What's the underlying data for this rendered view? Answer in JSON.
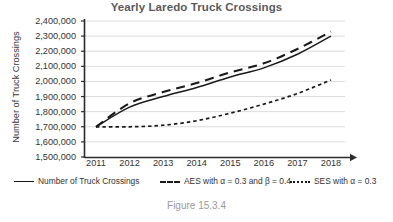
{
  "chart_data": {
    "type": "line",
    "title": "Yearly Laredo Truck Crossings",
    "xlabel": "",
    "ylabel": "Number of Truck Crossings",
    "categories": [
      "2011",
      "2012",
      "2013",
      "2014",
      "2015",
      "2016",
      "2017",
      "2018"
    ],
    "x": [
      2011,
      2012,
      2013,
      2014,
      2015,
      2016,
      2017,
      2018
    ],
    "ylim": [
      1500000,
      2400000
    ],
    "ytick_labels": [
      "2,400,000",
      "2,300,000",
      "2,200,000",
      "2,100,000",
      "2,000,000",
      "1,900,000",
      "1,800,000",
      "1,700,000",
      "1,600,000",
      "1,500,000"
    ],
    "ytick_values": [
      2400000,
      2300000,
      2200000,
      2100000,
      2000000,
      1900000,
      1800000,
      1700000,
      1600000,
      1500000
    ],
    "grid": true,
    "legend_position": "bottom",
    "series": [
      {
        "name": "Number of Truck Crossings",
        "style": "solid",
        "color": "#1a1a1a",
        "values": [
          1700000,
          1830000,
          1900000,
          1960000,
          2030000,
          2090000,
          2180000,
          2300000
        ]
      },
      {
        "name": "AES with α = 0.3 and β = 0.4",
        "style": "long-dash",
        "color": "#1a1a1a",
        "values": [
          1700000,
          1855000,
          1930000,
          1990000,
          2060000,
          2120000,
          2215000,
          2330000
        ]
      },
      {
        "name": "SES with α = 0.3",
        "style": "dotted",
        "color": "#1a1a1a",
        "values": [
          1700000,
          1700000,
          1710000,
          1740000,
          1790000,
          1850000,
          1920000,
          2010000
        ]
      }
    ]
  },
  "caption": "Figure 15.3.4",
  "legend": {
    "items": [
      {
        "label": "Number of Truck Crossings",
        "marker": "solid-line-marker"
      },
      {
        "label": "AES with α = 0.3 and β = 0.4",
        "marker": "dashed-line-marker"
      },
      {
        "label": "SES with α = 0.3",
        "marker": "dotted-line-marker"
      }
    ]
  }
}
